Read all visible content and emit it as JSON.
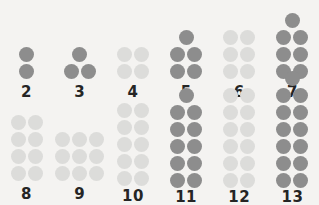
{
  "figure": {
    "background_color": "#f4f3f1",
    "prime_color": "#8d8d8d",
    "composite_color": "#dcdcda",
    "label_color": "#252525"
  },
  "rows": [
    {
      "name": "top-row",
      "cells": [
        {
          "label": "2",
          "value": 2,
          "kind": "prime",
          "top_single_dot": false,
          "columns": 1,
          "rows": 2,
          "clipped_top": false
        },
        {
          "label": "3",
          "value": 3,
          "kind": "prime",
          "top_single_dot": true,
          "columns": 2,
          "rows": 1,
          "clipped_top": false
        },
        {
          "label": "4",
          "value": 4,
          "kind": "composite",
          "top_single_dot": false,
          "columns": 2,
          "rows": 2,
          "clipped_top": false
        },
        {
          "label": "5",
          "value": 5,
          "kind": "prime",
          "top_single_dot": true,
          "columns": 2,
          "rows": 2,
          "clipped_top": false
        },
        {
          "label": "6",
          "value": 6,
          "kind": "composite",
          "top_single_dot": false,
          "columns": 2,
          "rows": 3,
          "clipped_top": false
        },
        {
          "label": "7",
          "value": 7,
          "kind": "prime",
          "top_single_dot": true,
          "columns": 2,
          "rows": 3,
          "clipped_top": true
        }
      ]
    },
    {
      "name": "bottom-row",
      "cells": [
        {
          "label": "8",
          "value": 8,
          "kind": "composite",
          "top_single_dot": false,
          "columns": 2,
          "rows": 4,
          "clipped_top": false
        },
        {
          "label": "9",
          "value": 9,
          "kind": "composite",
          "top_single_dot": false,
          "columns": 3,
          "rows": 3,
          "clipped_top": false
        },
        {
          "label": "10",
          "value": 10,
          "kind": "composite",
          "top_single_dot": false,
          "columns": 2,
          "rows": 5,
          "clipped_top": false
        },
        {
          "label": "11",
          "value": 11,
          "kind": "prime",
          "top_single_dot": true,
          "columns": 2,
          "rows": 5,
          "clipped_top": false
        },
        {
          "label": "12",
          "value": 12,
          "kind": "composite",
          "top_single_dot": false,
          "columns": 2,
          "rows": 6,
          "clipped_top": false
        },
        {
          "label": "13",
          "value": 13,
          "kind": "prime",
          "top_single_dot": true,
          "columns": 2,
          "rows": 6,
          "clipped_top": false
        }
      ]
    }
  ]
}
